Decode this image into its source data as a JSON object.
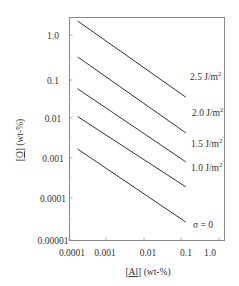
{
  "chart_data": {
    "type": "line",
    "title": "",
    "xlabel": "[Al] (wt-%)",
    "ylabel": "[O] (wt-%)",
    "xscale": "log",
    "yscale": "log",
    "xlim": [
      0.0001,
      1.0
    ],
    "ylim": [
      1e-05,
      2.8
    ],
    "grid": false,
    "legend_position": "inline-right",
    "x_ticks": [
      "0.0001",
      "0.001",
      "0.01",
      "0.1",
      "1.0"
    ],
    "y_ticks": [
      "1.0",
      "0.1",
      "0.01",
      "0.001",
      "0.0001",
      "0.00001"
    ],
    "series": [
      {
        "name": "2.5 J/m2",
        "label": "2.5 J/m",
        "sup": "2",
        "x": [
          0.00017,
          0.13
        ],
        "y": [
          2.2,
          0.03
        ]
      },
      {
        "name": "2.0 J/m2",
        "label": "2.0 J/m",
        "sup": "2",
        "x": [
          0.00017,
          0.13
        ],
        "y": [
          0.29,
          0.004
        ]
      },
      {
        "name": "1.5 J/m2",
        "label": "1.5 J/m",
        "sup": "2",
        "x": [
          0.00017,
          0.13
        ],
        "y": [
          0.048,
          0.00078
        ]
      },
      {
        "name": "1.0 J/m2",
        "label": "1.0 J/m",
        "sup": "2",
        "x": [
          0.00017,
          0.13
        ],
        "y": [
          0.01,
          0.00019
        ]
      },
      {
        "name": "σ = 0",
        "label": "σ = 0",
        "sup": "",
        "x": [
          0.00017,
          0.13
        ],
        "y": [
          0.0016,
          2.6e-05
        ]
      }
    ],
    "colors": {
      "line": "#333333",
      "frame": "#888888",
      "text": "#333333"
    }
  },
  "axes": {
    "x_label_prefix": "[",
    "x_label_sym": "Al",
    "x_label_suffix": "] (wt-%)",
    "y_label_prefix": "[",
    "y_label_sym": "O",
    "y_label_suffix": "] (wt-%)"
  }
}
